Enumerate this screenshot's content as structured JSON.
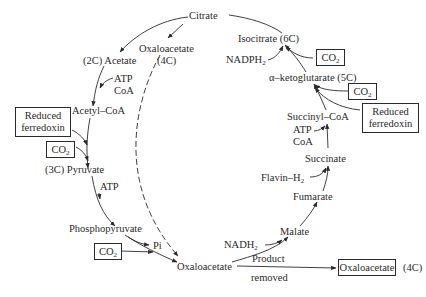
{
  "diagram": {
    "type": "metabolic-cycle",
    "nodes": {
      "citrate": "Citrate",
      "acetate": "(2C) Acetate",
      "oxaloacetate_top": "Oxaloacetate",
      "oxaloacetate_top_c": "(4C)",
      "acetyl_coa": "Acetyl–CoA",
      "pyruvate": "(3C) Pyruvate",
      "phosphopyruvate": "Phosphopyruvate",
      "oxaloacetate_bottom": "Oxaloacetate",
      "malate": "Malate",
      "fumarate": "Fumarate",
      "succinate": "Succinate",
      "succinyl_coa": "Succinyl–CoA",
      "ketoglutarate": "α–ketoglutarate (5C)",
      "isocitrate": "Isocitrate (6C)",
      "oxaloacetate_product": "Oxaloacetate",
      "oxaloacetate_product_c": "(4C)"
    },
    "cofactors": {
      "atp_coa_left_atp": "ATP",
      "atp_coa_left_coa": "CoA",
      "reduced_ferredoxin_left_1": "Reduced",
      "reduced_ferredoxin_left_2": "ferredoxin",
      "co2_left": "CO",
      "atp_pyruvate": "ATP",
      "pi": "Pi",
      "co2_bottom": "CO",
      "nadh2_base": "NADH",
      "flavin_base": "Flavin–H",
      "atp_right": "ATP",
      "coa_right": "CoA",
      "reduced_ferredoxin_right_1": "Reduced",
      "reduced_ferredoxin_right_2": "ferredoxin",
      "co2_right_lower": "CO",
      "co2_right_upper": "CO",
      "nadph2_base": "NADPH",
      "sub2": "2",
      "product_removed_1": "Product",
      "product_removed_2": "removed"
    }
  }
}
